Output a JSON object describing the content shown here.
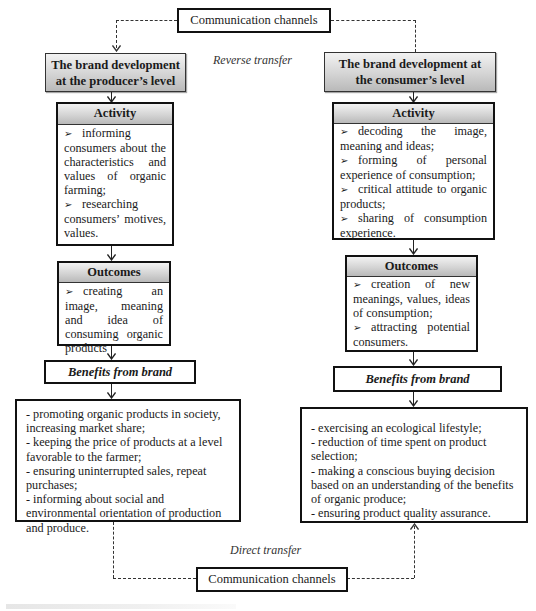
{
  "diagram": {
    "top_channel": {
      "label": "Communication channels"
    },
    "bottom_channel": {
      "label": "Communication channels"
    },
    "reverse_transfer_label": "Reverse transfer",
    "direct_transfer_label": "Direct transfer",
    "producer": {
      "title": "The brand development at the producer’s level",
      "title_lines": [
        "The brand development",
        "at the producer’s level"
      ],
      "activity": {
        "heading": "Activity",
        "items": [
          "informing consumers about the characteristics and values of organic farming;",
          "researching consumers’ motives, values."
        ]
      },
      "outcomes": {
        "heading": "Outcomes",
        "items": [
          "creating an image, meaning and idea of consuming organic products"
        ]
      },
      "benefits_heading": "Benefits from brand",
      "benefits": [
        "- promoting organic products in society, increasing market share;",
        "- keeping the price of products at a level favorable to the farmer;",
        "- ensuring uninterrupted sales, repeat purchases;",
        "- informing about social and environmental orientation of production and produce."
      ]
    },
    "consumer": {
      "title": "The brand development at the consumer’s level",
      "title_lines": [
        "The brand development at",
        "the consumer’s level"
      ],
      "activity": {
        "heading": "Activity",
        "items": [
          "decoding the image, meaning and ideas;",
          "forming of personal experience of consumption;",
          "critical attitude to organic products;",
          "sharing of consumption experience."
        ]
      },
      "outcomes": {
        "heading": "Outcomes",
        "items": [
          "creation of new meanings, values, ideas of consumption;",
          "attracting potential consumers."
        ]
      },
      "benefits_heading": "Benefits from brand",
      "benefits": [
        "- exercising an ecological lifestyle;",
        "- reduction of time spent on product selection;",
        "- making a conscious buying decision based on an understanding of the benefits of organic produce;",
        "- ensuring product quality assurance."
      ]
    },
    "bullet_glyph": "➢",
    "colors": {
      "header_gradient_top": "#f2f2f2",
      "header_gradient_bottom": "#b9b9b9",
      "border": "#111111",
      "connector": "#333333"
    }
  }
}
